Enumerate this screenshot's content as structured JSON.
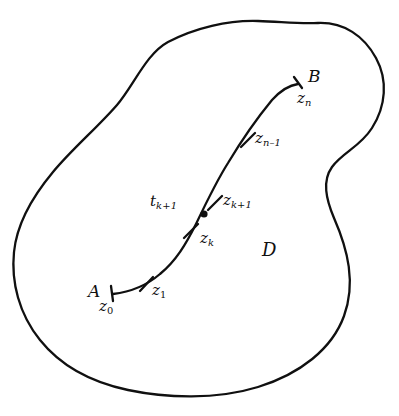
{
  "figure": {
    "background_color": "#ffffff",
    "stroke_color": "#101010",
    "width": 399,
    "height": 416
  },
  "region": {
    "name": "domain-boundary",
    "label": "D",
    "description": "closed simple curve bounding the region"
  },
  "contour": {
    "name": "contour-path",
    "start_point_label": "A",
    "end_point_label": "B",
    "start_parameter_label": "z",
    "end_parameter_label": "z"
  },
  "labels": {
    "point_a": "A",
    "point_b": "B",
    "domain": "D",
    "z0": {
      "base": "z",
      "sub": "0"
    },
    "z1": {
      "base": "z",
      "sub": "1"
    },
    "zk": {
      "base": "z",
      "sub": "k"
    },
    "zk1": {
      "base": "z",
      "sub": "k+1"
    },
    "zn1": {
      "base": "z",
      "sub": "n–1"
    },
    "zn": {
      "base": "z",
      "sub": "n"
    },
    "tk1": {
      "base": "t",
      "sub": "k+1"
    }
  },
  "markers": {
    "tick_count": 5,
    "dot_label": "t",
    "dot_sub": "k+1"
  }
}
